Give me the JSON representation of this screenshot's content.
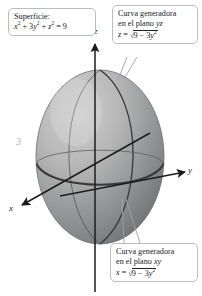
{
  "figure": {
    "background_color": "#ffffff"
  },
  "callouts": {
    "surface": {
      "name": "Superficie:",
      "label": "Superficie:",
      "equation_plain": "x^2 + 3y^2 + z^2 = 9",
      "eq_x": "x",
      "eq_x_exp": "2",
      "eq_plus1": " + 3",
      "eq_y": "y",
      "eq_y_exp": "2",
      "eq_plus2": " + ",
      "eq_z": "z",
      "eq_z_exp": "2",
      "eq_equals": " = 9"
    },
    "yz_curve": {
      "line1": "Curva generadora",
      "line2_pre": "en el plano ",
      "line2_plane": "yz",
      "equation_plain": "z = sqrt(9 - 3y^2)",
      "eq_lhs": "z",
      "eq_equals": " = ",
      "eq_radicand_pre": "9 − 3",
      "eq_radicand_var": "y",
      "eq_radicand_exp": "2"
    },
    "xy_curve": {
      "line1": "Curva generadora",
      "line2_pre": "en el plano ",
      "line2_plane": "xy",
      "equation_plain": "x = sqrt(9 - 3y^2)",
      "eq_lhs": "x",
      "eq_equals": " = ",
      "eq_radicand_pre": "9 − 3",
      "eq_radicand_var": "y",
      "eq_radicand_exp": "2"
    }
  },
  "axes": {
    "z_label": "z",
    "y_label": "y",
    "x_label": "x",
    "tick_label": "3"
  },
  "symbols": {
    "radical_sign": "√"
  },
  "colors": {
    "surface_light": "#cfcfcf",
    "surface_mid": "#9a9a9a",
    "surface_dark": "#6f7173",
    "trace_curve": "#3a3a3c",
    "axis": "#1c1c1c",
    "callout_border": "#b9bcc0",
    "leader_line": "#9fa2a6",
    "tick_text": "#b0b0b0"
  }
}
